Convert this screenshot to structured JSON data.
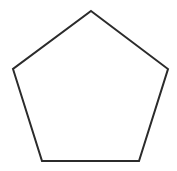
{
  "diagram": {
    "shape": "pentagon",
    "vertices": [
      [
        91,
        11
      ],
      [
        168,
        69
      ],
      [
        139,
        161
      ],
      [
        42,
        161
      ],
      [
        13,
        69
      ]
    ],
    "stroke": "#2b2b2b",
    "fill": "#ffffff",
    "stroke_width": 2,
    "background": "#ffffff"
  }
}
